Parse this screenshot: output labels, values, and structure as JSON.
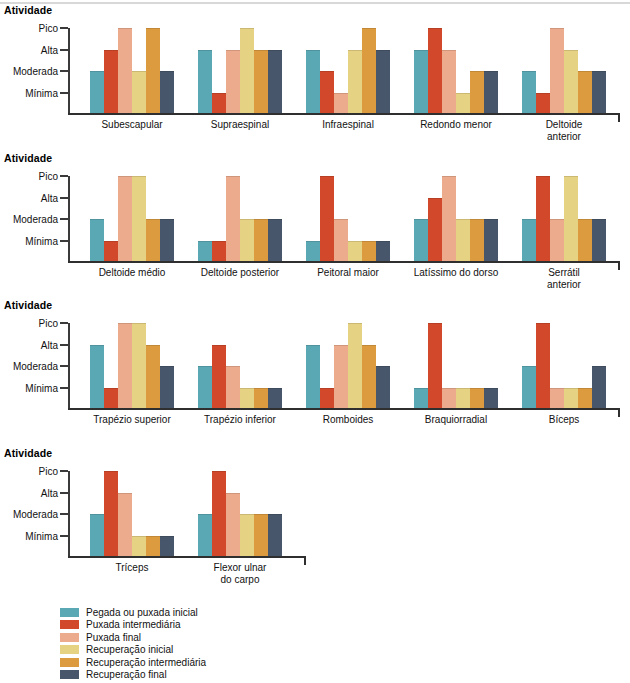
{
  "axis": {
    "title": "Atividade",
    "levels": [
      "Pico",
      "Alta",
      "Moderada",
      "Mínima"
    ]
  },
  "legend": {
    "items": [
      {
        "label": "Pegada ou puxada inicial",
        "color": "#5ba8b5"
      },
      {
        "label": "Puxada intermediária",
        "color": "#d1492a"
      },
      {
        "label": "Puxada final",
        "color": "#edab8d"
      },
      {
        "label": "Recuperação inicial",
        "color": "#e6d283"
      },
      {
        "label": "Recuperação intermediária",
        "color": "#dc9b3f"
      },
      {
        "label": "Recuperação final",
        "color": "#47566a"
      }
    ]
  },
  "chart_data": {
    "type": "bar",
    "xlabel": "",
    "ylabel": "Atividade",
    "ylim": [
      0,
      4
    ],
    "grid": false,
    "legend_position": "bottom-left",
    "value_scale": {
      "Mínima": 1,
      "Moderada": 2,
      "Alta": 3,
      "Pico": 4
    },
    "series_names": [
      "Pegada ou puxada inicial",
      "Puxada intermediária",
      "Puxada final",
      "Recuperação inicial",
      "Recuperação intermediária",
      "Recuperação final"
    ],
    "series_colors": [
      "#5ba8b5",
      "#d1492a",
      "#edab8d",
      "#e6d283",
      "#dc9b3f",
      "#47566a"
    ],
    "panels": [
      {
        "panel_title": "Atividade",
        "categories": [
          "Subescapular",
          "Supraespinal",
          "Infraespinal",
          "Redondo menor",
          "Deltoide anterior"
        ],
        "values": [
          [
            2,
            3,
            4,
            2,
            4,
            2
          ],
          [
            3,
            1,
            3,
            4,
            3,
            3
          ],
          [
            3,
            2,
            1,
            3,
            4,
            3
          ],
          [
            3,
            4,
            3,
            1,
            2,
            2
          ],
          [
            2,
            1,
            4,
            3,
            2,
            2
          ]
        ]
      },
      {
        "panel_title": "Atividade",
        "categories": [
          "Deltoide médio",
          "Deltoide posterior",
          "Peitoral maior",
          "Latíssimo do dorso",
          "Serrátil anterior"
        ],
        "values": [
          [
            2,
            1,
            4,
            4,
            2,
            2
          ],
          [
            1,
            1,
            4,
            2,
            2,
            2
          ],
          [
            1,
            4,
            2,
            1,
            1,
            1
          ],
          [
            2,
            3,
            4,
            2,
            2,
            2
          ],
          [
            2,
            4,
            2,
            4,
            2,
            2
          ]
        ]
      },
      {
        "panel_title": "Atividade",
        "categories": [
          "Trapézio superior",
          "Trapézio inferior",
          "Romboides",
          "Braquiorradial",
          "Bíceps"
        ],
        "values": [
          [
            3,
            1,
            4,
            4,
            3,
            2
          ],
          [
            2,
            3,
            2,
            1,
            1,
            1
          ],
          [
            3,
            1,
            3,
            4,
            3,
            2
          ],
          [
            1,
            4,
            1,
            1,
            1,
            1
          ],
          [
            2,
            4,
            1,
            1,
            1,
            2
          ]
        ]
      },
      {
        "panel_title": "Atividade",
        "categories": [
          "Tríceps",
          "Flexor ulnar\ndo carpo"
        ],
        "values": [
          [
            2,
            4,
            3,
            1,
            1,
            1
          ],
          [
            2,
            4,
            3,
            2,
            2,
            2
          ]
        ]
      }
    ]
  }
}
